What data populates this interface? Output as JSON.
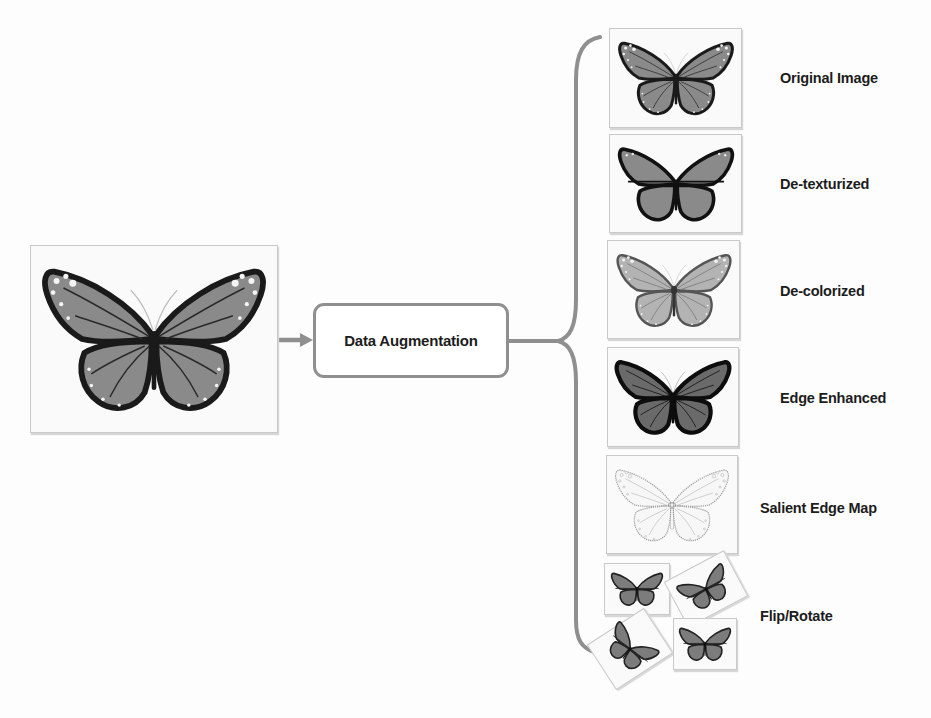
{
  "diagram": {
    "input": {
      "label": "Input butterfly image"
    },
    "process": {
      "label": "Data Augmentation"
    },
    "outputs": [
      {
        "label": "Original Image",
        "style": "original"
      },
      {
        "label": "De-texturized",
        "style": "detexturized"
      },
      {
        "label": "De-colorized",
        "style": "decolorized"
      },
      {
        "label": "Edge Enhanced",
        "style": "edge"
      },
      {
        "label": "Salient Edge Map",
        "style": "salient"
      },
      {
        "label": "Flip/Rotate",
        "style": "fliprotate"
      }
    ],
    "colors": {
      "connector": "#8f8f8f",
      "wing_fill": "#8a8a8a",
      "wing_border": "#1a1a1a",
      "box_border": "#c9c9c9",
      "text": "#1c1c1c"
    }
  }
}
